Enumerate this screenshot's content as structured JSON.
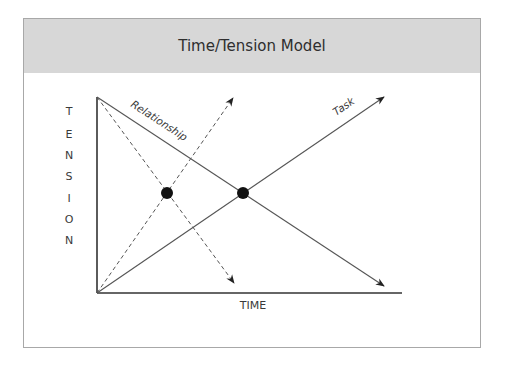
{
  "slide": {
    "title": "Time/Tension Model"
  },
  "diagram": {
    "x_axis_label": "TIME",
    "y_axis_label": "TENSION",
    "y_axis_letters": [
      "T",
      "E",
      "N",
      "S",
      "I",
      "O",
      "N"
    ],
    "lines": [
      {
        "name": "Relationship",
        "style": "solid",
        "direction": "decreasing",
        "label": "Relationship"
      },
      {
        "name": "Task",
        "style": "solid",
        "direction": "increasing",
        "label": "Task"
      },
      {
        "name": "Relationship (accelerated)",
        "style": "dashed",
        "direction": "decreasing",
        "label": ""
      },
      {
        "name": "Task (accelerated)",
        "style": "dashed",
        "direction": "increasing",
        "label": ""
      }
    ],
    "intersections": [
      {
        "name": "dashed-crossover",
        "style": "filled-dot"
      },
      {
        "name": "solid-crossover",
        "style": "filled-dot"
      }
    ],
    "colors": {
      "header_bg": "#d7d7d7",
      "frame_border": "#a8a8a8",
      "line": "#555555",
      "axis": "#333333",
      "dot": "#111111"
    }
  }
}
